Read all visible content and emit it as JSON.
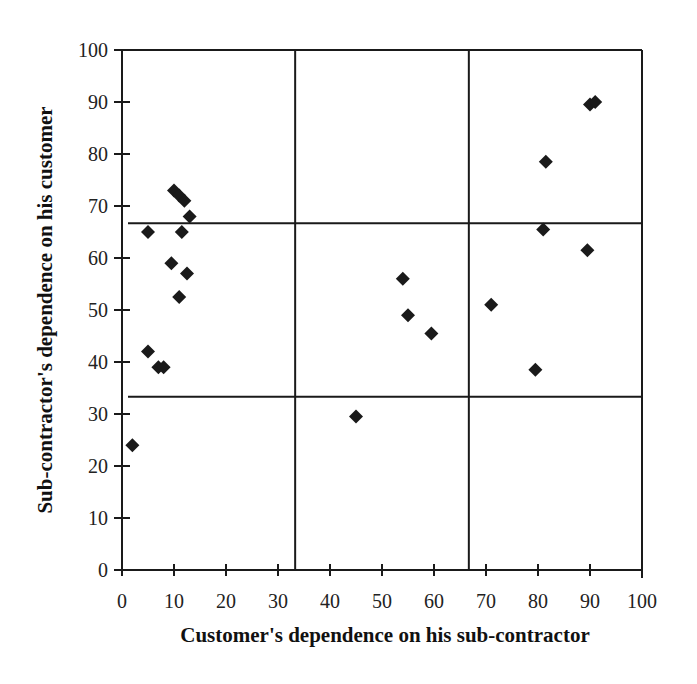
{
  "chart_data": {
    "type": "scatter",
    "title": "",
    "xlabel": "Customer's dependence on his sub-contractor",
    "ylabel": "Sub-contractor's dependence on his customer",
    "xlim": [
      0,
      100
    ],
    "ylim": [
      0,
      100
    ],
    "x_ticks": [
      0,
      10,
      20,
      30,
      40,
      50,
      60,
      70,
      80,
      90,
      100
    ],
    "y_ticks": [
      0,
      10,
      20,
      30,
      40,
      50,
      60,
      70,
      80,
      90,
      100
    ],
    "grid": false,
    "divider_lines": {
      "vertical": [
        33.3,
        66.7
      ],
      "horizontal": [
        33.3,
        66.7
      ]
    },
    "marker": "diamond",
    "marker_color": "#1a1a1a",
    "series": [
      {
        "name": "relationships",
        "points": [
          {
            "x": 2,
            "y": 24
          },
          {
            "x": 5,
            "y": 65
          },
          {
            "x": 5,
            "y": 42
          },
          {
            "x": 7,
            "y": 39
          },
          {
            "x": 8,
            "y": 39
          },
          {
            "x": 9.5,
            "y": 59
          },
          {
            "x": 10,
            "y": 73
          },
          {
            "x": 11,
            "y": 72
          },
          {
            "x": 11,
            "y": 52.5
          },
          {
            "x": 11.5,
            "y": 65
          },
          {
            "x": 12,
            "y": 71
          },
          {
            "x": 12.5,
            "y": 57
          },
          {
            "x": 13,
            "y": 68
          },
          {
            "x": 45,
            "y": 29.5
          },
          {
            "x": 54,
            "y": 56
          },
          {
            "x": 55,
            "y": 49
          },
          {
            "x": 59.5,
            "y": 45.5
          },
          {
            "x": 71,
            "y": 51
          },
          {
            "x": 79.5,
            "y": 38.5
          },
          {
            "x": 81,
            "y": 65.5
          },
          {
            "x": 81.5,
            "y": 78.5
          },
          {
            "x": 89.5,
            "y": 61.5
          },
          {
            "x": 90,
            "y": 89.5
          },
          {
            "x": 91,
            "y": 90
          }
        ]
      }
    ]
  }
}
